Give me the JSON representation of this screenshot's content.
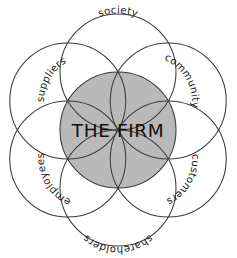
{
  "diagram": {
    "center": {
      "label": "THE FIRM",
      "fill_color": "#b9b9b9",
      "stroke_color": "#3a3a3a",
      "cx": 118,
      "cy": 130,
      "r": 58
    },
    "background_color": "#ffffff",
    "stroke_color": "#3a3a3a",
    "petal_radius": 58,
    "petal_orbit_radius": 58,
    "stakeholders": [
      {
        "id": "society",
        "label": "society",
        "angle_deg": -90,
        "cx": 118,
        "cy": 72
      },
      {
        "id": "community",
        "label": "community",
        "angle_deg": -30,
        "cx": 168.23,
        "cy": 101
      },
      {
        "id": "customers",
        "label": "customers",
        "angle_deg": 30,
        "cx": 168.23,
        "cy": 159
      },
      {
        "id": "shareholders",
        "label": "shareholders",
        "angle_deg": 90,
        "cx": 118,
        "cy": 188
      },
      {
        "id": "employees",
        "label": "employees",
        "angle_deg": 150,
        "cx": 67.77,
        "cy": 159
      },
      {
        "id": "suppliers",
        "label": "suppliers",
        "angle_deg": 210,
        "cx": 67.77,
        "cy": 101
      }
    ]
  }
}
